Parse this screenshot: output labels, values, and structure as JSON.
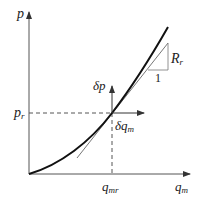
{
  "diagram": {
    "type": "pressure-flow characteristic curve with tangent linearization",
    "axes": {
      "y_label": "p",
      "x_label": "q",
      "x_label_sub": "m"
    },
    "operating_point": {
      "p_label": "p",
      "p_label_sub": "r",
      "q_label": "q",
      "q_label_sub": "mr"
    },
    "increments": {
      "dp_label": "δp",
      "dq_label": "δq",
      "dq_label_sub": "m"
    },
    "slope_triangle": {
      "rise_label": "R",
      "rise_label_sub": "r",
      "run_label": "1"
    },
    "colors": {
      "curve": "#111111",
      "axes": "#555555",
      "tangent": "#666666",
      "dashed": "#555555"
    }
  }
}
